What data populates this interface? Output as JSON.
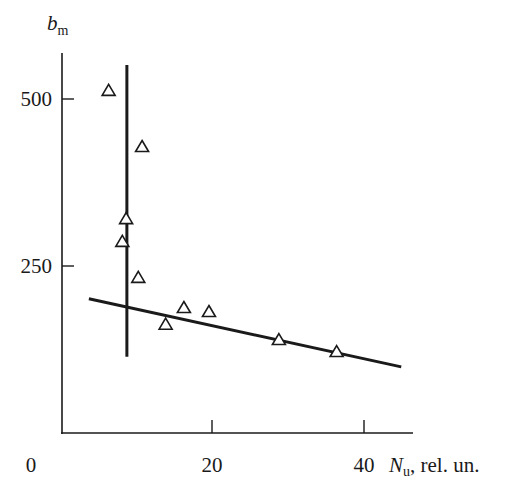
{
  "chart_data": {
    "type": "scatter",
    "title": "",
    "xlabel": "N_u, rel. un.",
    "xlabel_parts": {
      "symbol": "N",
      "subscript": "u",
      "suffix": ", rel. un."
    },
    "ylabel": "b_m",
    "ylabel_parts": {
      "symbol": "b",
      "subscript": "m"
    },
    "xlim": [
      0,
      46
    ],
    "ylim": [
      0,
      560
    ],
    "x_ticks": [
      {
        "value": 0,
        "label": "0"
      },
      {
        "value": 20,
        "label": "20"
      },
      {
        "value": 40,
        "label": "40"
      }
    ],
    "y_ticks": [
      {
        "value": 250,
        "label": "250"
      },
      {
        "value": 500,
        "label": "500"
      }
    ],
    "grid": false,
    "legend": null,
    "series": [
      {
        "name": "measurements",
        "marker": "open-triangle",
        "points": [
          {
            "x": 6.4,
            "y": 512
          },
          {
            "x": 10.8,
            "y": 428
          },
          {
            "x": 8.7,
            "y": 320
          },
          {
            "x": 8.2,
            "y": 286
          },
          {
            "x": 10.3,
            "y": 232
          },
          {
            "x": 13.9,
            "y": 162
          },
          {
            "x": 16.3,
            "y": 187
          },
          {
            "x": 19.6,
            "y": 181
          },
          {
            "x": 28.8,
            "y": 139
          },
          {
            "x": 36.4,
            "y": 121
          }
        ]
      }
    ],
    "lines": [
      {
        "name": "vertical-fit-line",
        "x1": 8.8,
        "y1": 551,
        "x2": 8.8,
        "y2": 114
      },
      {
        "name": "sloped-fit-line",
        "x1": 3.8,
        "y1": 201,
        "x2": 44.9,
        "y2": 99
      }
    ],
    "colors": {
      "ink": "#1a1a1a",
      "background": "#ffffff",
      "marker_fill": "#ffffff"
    }
  }
}
